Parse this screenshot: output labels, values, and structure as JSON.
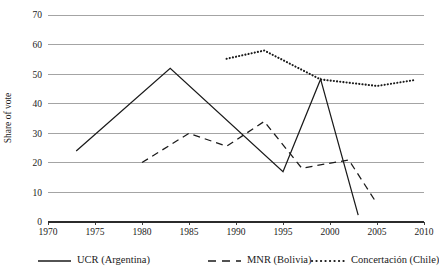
{
  "chart_data": {
    "type": "line",
    "title": "",
    "xlabel": "",
    "ylabel": "Share of vote",
    "xlim": [
      1970,
      2010
    ],
    "ylim": [
      0,
      70
    ],
    "grid": true,
    "legend_position": "bottom",
    "x_ticks": [
      1970,
      1975,
      1980,
      1985,
      1990,
      1995,
      2000,
      2005,
      2010
    ],
    "y_ticks": [
      0,
      10,
      20,
      30,
      40,
      50,
      60,
      70
    ],
    "series": [
      {
        "name": "UCR (Argentina)",
        "style": "solid",
        "color": "#1a1a1a",
        "points": [
          [
            1973,
            24.0
          ],
          [
            1983,
            52.0
          ],
          [
            1995,
            17.0
          ],
          [
            1999,
            48.3
          ],
          [
            2003,
            2.3
          ]
        ]
      },
      {
        "name": "MNR (Bolivia)",
        "style": "dashed",
        "color": "#1a1a1a",
        "points": [
          [
            1980,
            20.1
          ],
          [
            1985,
            30.0
          ],
          [
            1989,
            25.6
          ],
          [
            1993,
            34.0
          ],
          [
            1997,
            18.2
          ],
          [
            2002,
            21.0
          ],
          [
            2005,
            6.2
          ]
        ]
      },
      {
        "name": "Concertación (Chile)",
        "style": "dotted",
        "color": "#1a1a1a",
        "points": [
          [
            1989,
            55.2
          ],
          [
            1993,
            58.0
          ],
          [
            1999,
            48.2
          ],
          [
            2005,
            46.0
          ],
          [
            2009,
            48.0
          ]
        ]
      }
    ]
  },
  "legend": {
    "entries": [
      {
        "label": "UCR (Argentina)",
        "style": "solid"
      },
      {
        "label": "MNR (Bolivia)",
        "style": "dashed"
      },
      {
        "label": "Concertación (Chile)",
        "style": "dotted"
      }
    ]
  },
  "axis": {
    "y_title": "Share of vote",
    "y_tick_labels": [
      "0",
      "10",
      "20",
      "30",
      "40",
      "50",
      "60",
      "70"
    ],
    "x_tick_labels": [
      "1970",
      "1975",
      "1980",
      "1985",
      "1990",
      "1995",
      "2000",
      "2005",
      "2010"
    ]
  }
}
